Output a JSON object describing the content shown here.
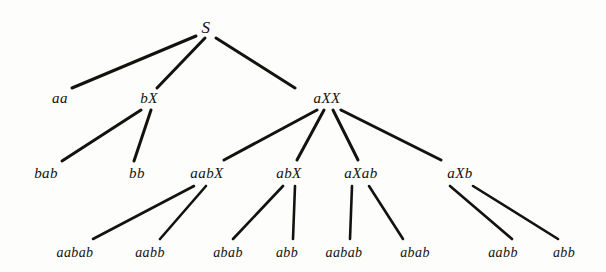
{
  "figure": {
    "background_color": "#fdfdfb",
    "ink_color": "#14120f",
    "width": 606,
    "height": 272
  },
  "style": {
    "edge_width_thick": 3.0,
    "edge_width_thin": 2.6
  },
  "nodes": [
    {
      "id": "n0",
      "label": "S",
      "x": 206,
      "y": 27,
      "level": 0,
      "css": "node-root"
    },
    {
      "id": "n1",
      "label": "aa",
      "x": 60,
      "y": 98,
      "level": 1,
      "css": "node-level1"
    },
    {
      "id": "n2",
      "label": "bX",
      "x": 149,
      "y": 98,
      "level": 1,
      "css": "node-level1"
    },
    {
      "id": "n3",
      "label": "aXX",
      "x": 327,
      "y": 98,
      "level": 1,
      "css": "node-level1"
    },
    {
      "id": "n4",
      "label": "bab",
      "x": 46,
      "y": 173,
      "level": 2,
      "css": "node-level2"
    },
    {
      "id": "n5",
      "label": "bb",
      "x": 137,
      "y": 173,
      "level": 2,
      "css": "node-level2"
    },
    {
      "id": "n6",
      "label": "aabX",
      "x": 207,
      "y": 173,
      "level": 2,
      "css": "node-level2"
    },
    {
      "id": "n7",
      "label": "abX",
      "x": 289,
      "y": 173,
      "level": 2,
      "css": "node-level2"
    },
    {
      "id": "n8",
      "label": "aXab",
      "x": 361,
      "y": 173,
      "level": 2,
      "css": "node-level2"
    },
    {
      "id": "n9",
      "label": "aXb",
      "x": 460,
      "y": 173,
      "level": 2,
      "css": "node-level2"
    },
    {
      "id": "n10",
      "label": "aabab",
      "x": 75,
      "y": 253,
      "level": 3,
      "css": "node-leaf"
    },
    {
      "id": "n11",
      "label": "aabb",
      "x": 150,
      "y": 253,
      "level": 3,
      "css": "node-leaf"
    },
    {
      "id": "n12",
      "label": "abab",
      "x": 228,
      "y": 253,
      "level": 3,
      "css": "node-leaf"
    },
    {
      "id": "n13",
      "label": "abb",
      "x": 287,
      "y": 253,
      "level": 3,
      "css": "node-leaf"
    },
    {
      "id": "n14",
      "label": "aabab",
      "x": 344,
      "y": 253,
      "level": 3,
      "css": "node-leaf"
    },
    {
      "id": "n15",
      "label": "abab",
      "x": 415,
      "y": 253,
      "level": 3,
      "css": "node-leaf"
    },
    {
      "id": "n16",
      "label": "aabb",
      "x": 503,
      "y": 253,
      "level": 3,
      "css": "node-leaf"
    },
    {
      "id": "n17",
      "label": "abb",
      "x": 564,
      "y": 253,
      "level": 3,
      "css": "node-leaf"
    }
  ],
  "edges": [
    {
      "from": "n0",
      "to": "n1",
      "x1": 196,
      "y1": 36,
      "x2": 72,
      "y2": 88,
      "w": 3.0
    },
    {
      "from": "n0",
      "to": "n2",
      "x1": 205,
      "y1": 38,
      "x2": 157,
      "y2": 88,
      "w": 3.0
    },
    {
      "from": "n0",
      "to": "n3",
      "x1": 216,
      "y1": 38,
      "x2": 295,
      "y2": 88,
      "w": 3.0
    },
    {
      "from": "n2",
      "to": "n4",
      "x1": 141,
      "y1": 110,
      "x2": 62,
      "y2": 161,
      "w": 3.0
    },
    {
      "from": "n2",
      "to": "n5",
      "x1": 151,
      "y1": 110,
      "x2": 134,
      "y2": 161,
      "w": 3.0
    },
    {
      "from": "n3",
      "to": "n6",
      "x1": 317,
      "y1": 110,
      "x2": 224,
      "y2": 160,
      "w": 3.0
    },
    {
      "from": "n3",
      "to": "n7",
      "x1": 324,
      "y1": 110,
      "x2": 297,
      "y2": 160,
      "w": 3.0
    },
    {
      "from": "n3",
      "to": "n8",
      "x1": 333,
      "y1": 110,
      "x2": 358,
      "y2": 160,
      "w": 3.0
    },
    {
      "from": "n3",
      "to": "n9",
      "x1": 341,
      "y1": 110,
      "x2": 441,
      "y2": 160,
      "w": 3.0
    },
    {
      "from": "n6",
      "to": "n10",
      "x1": 194,
      "y1": 186,
      "x2": 93,
      "y2": 239,
      "w": 2.6
    },
    {
      "from": "n6",
      "to": "n11",
      "x1": 206,
      "y1": 186,
      "x2": 160,
      "y2": 239,
      "w": 2.6
    },
    {
      "from": "n7",
      "to": "n12",
      "x1": 283,
      "y1": 186,
      "x2": 233,
      "y2": 239,
      "w": 2.6
    },
    {
      "from": "n7",
      "to": "n13",
      "x1": 295,
      "y1": 186,
      "x2": 293,
      "y2": 239,
      "w": 2.6
    },
    {
      "from": "n8",
      "to": "n14",
      "x1": 352,
      "y1": 186,
      "x2": 350,
      "y2": 239,
      "w": 2.6
    },
    {
      "from": "n8",
      "to": "n15",
      "x1": 369,
      "y1": 186,
      "x2": 403,
      "y2": 239,
      "w": 2.6
    },
    {
      "from": "n9",
      "to": "n16",
      "x1": 450,
      "y1": 186,
      "x2": 512,
      "y2": 239,
      "w": 2.6
    },
    {
      "from": "n9",
      "to": "n17",
      "x1": 473,
      "y1": 186,
      "x2": 558,
      "y2": 239,
      "w": 2.6
    }
  ]
}
